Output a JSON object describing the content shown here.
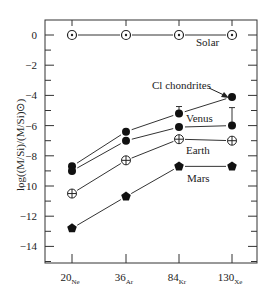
{
  "chart_data": {
    "type": "line",
    "title": "",
    "xlabel": "",
    "ylabel": "log((M/Si)/(M/Si)⊙)",
    "categories": [
      {
        "mass": "20",
        "element": "Ne"
      },
      {
        "mass": "36",
        "element": "Ar"
      },
      {
        "mass": "84",
        "element": "Kr"
      },
      {
        "mass": "130",
        "element": "Xe"
      }
    ],
    "ylim": [
      -15,
      1
    ],
    "yticks": [
      0,
      -2,
      -4,
      -6,
      -8,
      -10,
      -12,
      -14
    ],
    "grid": false,
    "series": [
      {
        "name": "Solar",
        "marker": "circle-dot",
        "values": [
          0,
          0,
          0,
          0
        ]
      },
      {
        "name": "Cl chondrites",
        "marker": "filled-circle",
        "values": [
          -8.7,
          -6.4,
          -5.2,
          -4.1
        ],
        "error_bar_at": [
          2
        ]
      },
      {
        "name": "Venus",
        "marker": "filled-circle",
        "values": [
          -9.0,
          -7.0,
          -6.1,
          -6.0
        ],
        "error_bar_at": [
          3
        ]
      },
      {
        "name": "Earth",
        "marker": "circle-plus",
        "values": [
          -10.5,
          -8.3,
          -6.9,
          -7.0
        ]
      },
      {
        "name": "Mars",
        "marker": "filled-pentagon",
        "values": [
          -12.8,
          -10.7,
          -8.7,
          -8.7
        ]
      }
    ],
    "labels": [
      {
        "text": "Solar",
        "x": 196,
        "y": 46
      },
      {
        "text": "Cl chondrites",
        "x": 152,
        "y": 89,
        "arrow": true
      },
      {
        "text": "Venus",
        "x": 186,
        "y": 122
      },
      {
        "text": "Earth",
        "x": 186,
        "y": 154
      },
      {
        "text": "Mars",
        "x": 187,
        "y": 182
      }
    ]
  }
}
